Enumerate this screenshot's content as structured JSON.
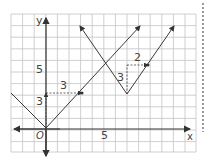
{
  "diagram": {
    "title": "",
    "type": "coordinate-grid-graph",
    "axes": {
      "x_label": "x",
      "y_label": "y",
      "origin_label": "O",
      "x_tick_label": "5",
      "y_tick_label": "5"
    },
    "grid": {
      "x_min": -3,
      "x_max": 13,
      "y_min": -2,
      "y_max": 10
    },
    "graphs": [
      {
        "name": "y = |x|",
        "vertex": [
          0,
          0
        ],
        "left_end": [
          -3,
          3
        ],
        "right_end": [
          8,
          8
        ]
      },
      {
        "name": "translated V",
        "vertex": [
          7,
          3
        ],
        "left_end": [
          4,
          9
        ],
        "right_end": [
          11,
          9
        ]
      }
    ],
    "annotations": {
      "translation_vertical_1": "3",
      "translation_horizontal_1": "3",
      "translation_vertical_2": "3",
      "translation_horizontal_2": "2"
    },
    "colors": {
      "grid": "#bcbcbc",
      "axis": "#333333",
      "curve": "#3a3a3a"
    }
  }
}
